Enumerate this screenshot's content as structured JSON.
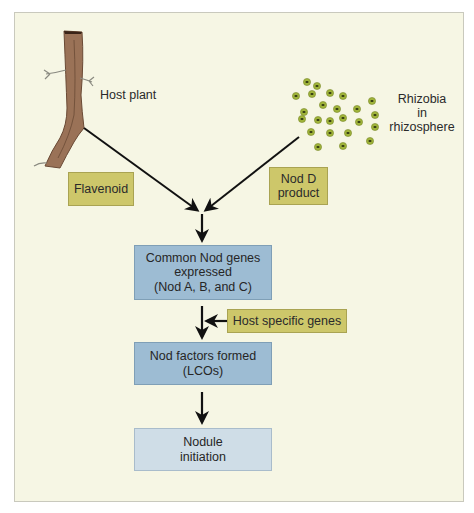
{
  "diagram": {
    "title_labels": {
      "host_plant": "Host plant",
      "rhizobia": [
        "Rhizobia",
        "in",
        "rhizosphere"
      ]
    },
    "signals": {
      "flavenoid": "Flavenoid",
      "nod_d": [
        "Nod D",
        "product"
      ],
      "host_specific": "Host specific genes"
    },
    "steps": [
      {
        "lines": [
          "Common Nod genes",
          "expressed",
          "(Nod A, B, and C)"
        ]
      },
      {
        "lines": [
          "Nod factors formed",
          "(LCOs)"
        ]
      },
      {
        "lines": [
          "Nodule",
          "initiation"
        ]
      }
    ],
    "colors": {
      "background": "#f6f6e4",
      "signal_box": "#cdc76a",
      "step_box": "#9dbcd3",
      "final_step_box": "#cfdde7",
      "root": "#9a7257",
      "bacteria": "#9fb33a",
      "arrow": "#111111"
    },
    "flow": [
      "Host plant -> Flavenoid -> converge",
      "Rhizobia in rhizosphere -> Nod D product -> converge",
      "converge -> Common Nod genes expressed (Nod A, B, and C)",
      "Common Nod genes expressed + Host specific genes -> Nod factors formed (LCOs)",
      "Nod factors formed (LCOs) -> Nodule initiation"
    ]
  }
}
